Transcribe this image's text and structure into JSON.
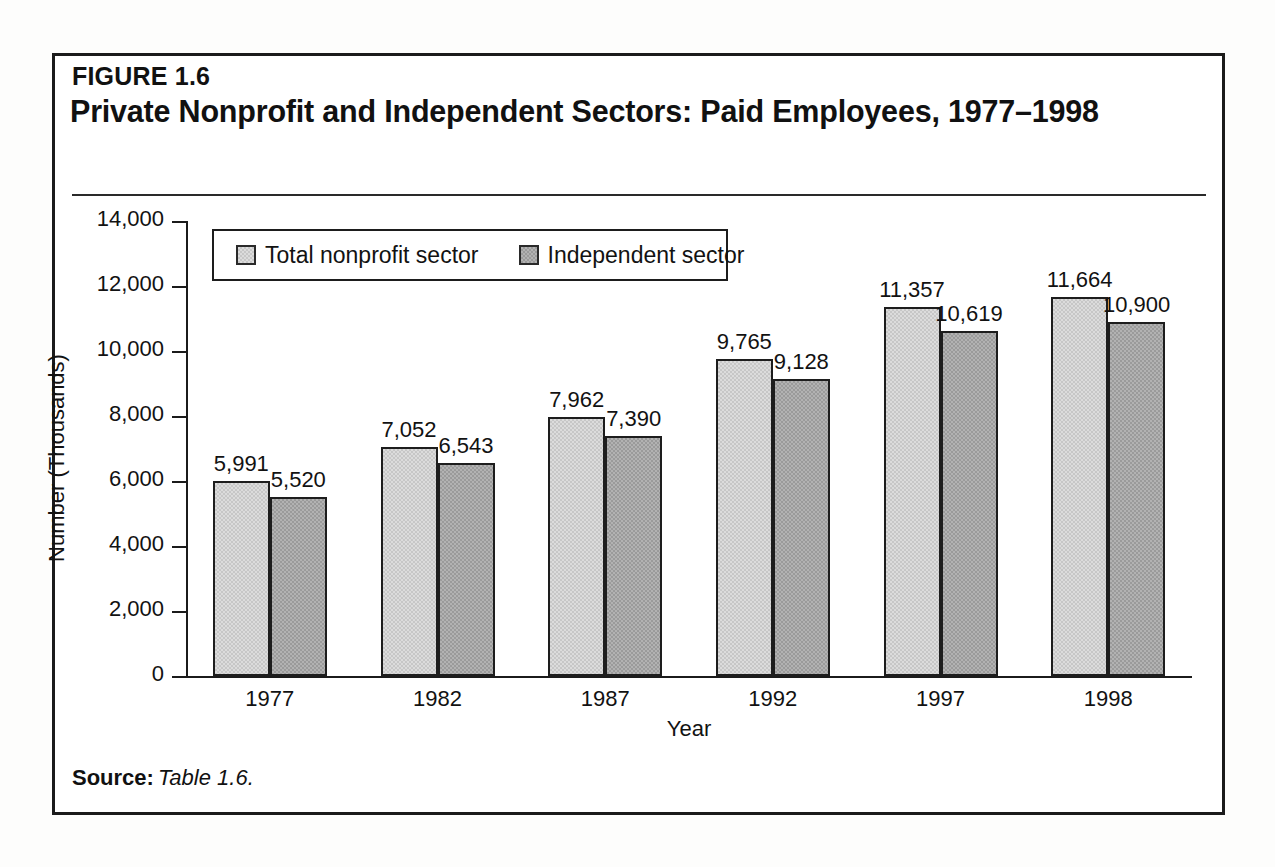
{
  "figure": {
    "number_label": "FIGURE 1.6",
    "title": "Private Nonprofit and Independent Sectors: Paid Employees, 1977–1998",
    "source_key": "Source:",
    "source_value": "Table 1.6."
  },
  "colors": {
    "series_light": "#dcdcdc",
    "series_dark": "#b2b2b2",
    "ink": "#1b1b1b",
    "paper": "#ffffff"
  },
  "chart_data": {
    "type": "bar",
    "title": "Private Nonprofit and Independent Sectors: Paid Employees, 1977–1998",
    "xlabel": "Year",
    "ylabel": "Number (Thousands)",
    "categories": [
      "1977",
      "1982",
      "1987",
      "1992",
      "1997",
      "1998"
    ],
    "series": [
      {
        "name": "Total nonprofit sector",
        "color": "#dcdcdc",
        "values": [
          5991,
          7052,
          7962,
          9765,
          11357,
          11664
        ],
        "labels": [
          "5,991",
          "7,052",
          "7,962",
          "9,765",
          "11,357",
          "11,664"
        ]
      },
      {
        "name": "Independent sector",
        "color": "#b2b2b2",
        "values": [
          5520,
          6543,
          7390,
          9128,
          10619,
          10900
        ],
        "labels": [
          "5,520",
          "6,543",
          "7,390",
          "9,128",
          "10,619",
          "10,900"
        ]
      }
    ],
    "ylim": [
      0,
      14000
    ],
    "ytick_values": [
      0,
      2000,
      4000,
      6000,
      8000,
      10000,
      12000,
      14000
    ],
    "ytick_labels": [
      "0",
      "2,000",
      "4,000",
      "6,000",
      "8,000",
      "10,000",
      "12,000",
      "14,000"
    ],
    "grid": false,
    "legend_position": "upper-left-inside",
    "legend_entries": [
      "Total nonprofit sector",
      "Independent sector"
    ]
  }
}
